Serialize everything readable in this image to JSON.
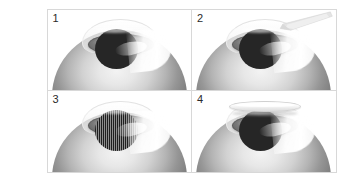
{
  "figure": {
    "layout": "2x2 grid",
    "background_color": "#ffffff",
    "border_color": "#d8d8d8",
    "panel_count": 4,
    "panels": [
      {
        "number": "1",
        "caption": "",
        "scene": "eye-baseline",
        "has_instrument": false,
        "has_flap": false,
        "pupil_style": "solid",
        "pupil_color": "#262626",
        "iris_color": "#8e8e8e",
        "sclera_color": "#d2d2d2",
        "highlight_color": "#ffffff"
      },
      {
        "number": "2",
        "caption": "",
        "scene": "eye-with-instrument",
        "has_instrument": true,
        "has_flap": false,
        "pupil_style": "solid",
        "pupil_color": "#262626",
        "iris_color": "#8e8e8e",
        "sclera_color": "#d2d2d2",
        "highlight_color": "#ffffff",
        "instrument_color": "#e2e2e2"
      },
      {
        "number": "3",
        "caption": "",
        "scene": "eye-striated-pupil",
        "has_instrument": false,
        "has_flap": false,
        "pupil_style": "striated",
        "pupil_color": "#1f1f1f",
        "iris_color": "#8e8e8e",
        "sclera_color": "#d2d2d2",
        "highlight_color": "#ffffff"
      },
      {
        "number": "4",
        "caption": "",
        "scene": "eye-with-flap",
        "has_instrument": false,
        "has_flap": true,
        "pupil_style": "solid",
        "pupil_color": "#262626",
        "iris_color": "#8e8e8e",
        "sclera_color": "#d2d2d2",
        "highlight_color": "#ffffff",
        "flap_color": "#f2f2f2"
      }
    ]
  }
}
